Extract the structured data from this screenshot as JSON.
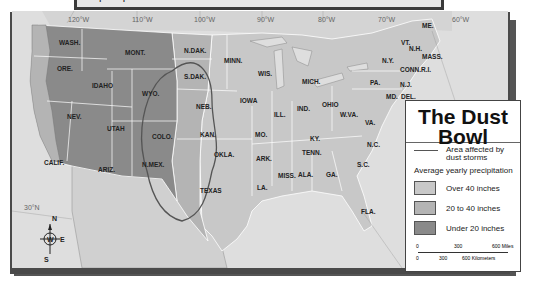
{
  "question": {
    "text": "precipitation was a cause of the Dust Bowl?"
  },
  "map": {
    "longitude_labels": [
      {
        "label": "120°W",
        "x": 62
      },
      {
        "label": "110°W",
        "x": 125
      },
      {
        "label": "100°W",
        "x": 188
      },
      {
        "label": "90°W",
        "x": 250
      },
      {
        "label": "80°W",
        "x": 311
      },
      {
        "label": "70°W",
        "x": 370
      },
      {
        "label": "60°W",
        "x": 448
      }
    ],
    "latitude_label": "30°N",
    "states": [
      {
        "name": "WASH.",
        "x": 47,
        "y": 28
      },
      {
        "name": "MONT.",
        "x": 113,
        "y": 38
      },
      {
        "name": "ORE.",
        "x": 45,
        "y": 54
      },
      {
        "name": "IDAHO",
        "x": 80,
        "y": 71
      },
      {
        "name": "WYO.",
        "x": 130,
        "y": 79
      },
      {
        "name": "N.DAK.",
        "x": 172,
        "y": 36
      },
      {
        "name": "S.DAK.",
        "x": 172,
        "y": 62
      },
      {
        "name": "MINN.",
        "x": 212,
        "y": 46
      },
      {
        "name": "WIS.",
        "x": 246,
        "y": 59
      },
      {
        "name": "MICH.",
        "x": 290,
        "y": 67
      },
      {
        "name": "NEV.",
        "x": 55,
        "y": 102
      },
      {
        "name": "UTAH",
        "x": 95,
        "y": 114
      },
      {
        "name": "COLO.",
        "x": 140,
        "y": 122
      },
      {
        "name": "NEB.",
        "x": 184,
        "y": 92
      },
      {
        "name": "IOWA",
        "x": 228,
        "y": 86
      },
      {
        "name": "ILL.",
        "x": 262,
        "y": 100
      },
      {
        "name": "IND.",
        "x": 285,
        "y": 94
      },
      {
        "name": "OHIO",
        "x": 310,
        "y": 90
      },
      {
        "name": "KAN.",
        "x": 188,
        "y": 120
      },
      {
        "name": "MO.",
        "x": 243,
        "y": 120
      },
      {
        "name": "KY.",
        "x": 298,
        "y": 124
      },
      {
        "name": "W.VA.",
        "x": 328,
        "y": 100
      },
      {
        "name": "VA.",
        "x": 353,
        "y": 108
      },
      {
        "name": "CALIF.",
        "x": 32,
        "y": 148
      },
      {
        "name": "ARIZ.",
        "x": 86,
        "y": 155
      },
      {
        "name": "N.MEX.",
        "x": 130,
        "y": 150
      },
      {
        "name": "OKLA.",
        "x": 202,
        "y": 140
      },
      {
        "name": "ARK.",
        "x": 244,
        "y": 144
      },
      {
        "name": "TENN.",
        "x": 290,
        "y": 138
      },
      {
        "name": "N.C.",
        "x": 355,
        "y": 130
      },
      {
        "name": "S.C.",
        "x": 345,
        "y": 150
      },
      {
        "name": "TEXAS",
        "x": 188,
        "y": 176
      },
      {
        "name": "LA.",
        "x": 245,
        "y": 173
      },
      {
        "name": "MISS.",
        "x": 266,
        "y": 161
      },
      {
        "name": "ALA.",
        "x": 286,
        "y": 160
      },
      {
        "name": "GA.",
        "x": 314,
        "y": 160
      },
      {
        "name": "FLA.",
        "x": 349,
        "y": 197
      },
      {
        "name": "ME.",
        "x": 410,
        "y": 11
      },
      {
        "name": "VT.",
        "x": 389,
        "y": 28
      },
      {
        "name": "N.H.",
        "x": 397,
        "y": 34
      },
      {
        "name": "N.Y.",
        "x": 370,
        "y": 46
      },
      {
        "name": "MASS.",
        "x": 410,
        "y": 42
      },
      {
        "name": "CONN.",
        "x": 388,
        "y": 55
      },
      {
        "name": "R.I.",
        "x": 409,
        "y": 55
      },
      {
        "name": "PA.",
        "x": 358,
        "y": 68
      },
      {
        "name": "N.J.",
        "x": 388,
        "y": 70
      },
      {
        "name": "MD.",
        "x": 374,
        "y": 82
      },
      {
        "name": "DEL.",
        "x": 389,
        "y": 82
      }
    ],
    "compass": {
      "n": "N",
      "s": "S",
      "e": "E",
      "w": "W"
    },
    "colors": {
      "over_40": "#c8c8c8",
      "between_20_40": "#b4b4b4",
      "under_20": "#8a8a8a",
      "water": "#dcdcdc",
      "frame": "#444444"
    }
  },
  "legend": {
    "title_line1": "The Dust",
    "title_line2": "Bowl",
    "dust_area_label": "Area affected by dust storms",
    "precip_heading": "Average yearly precipitation",
    "items": [
      {
        "label": "Over 40 inches",
        "color": "#c8c8c8"
      },
      {
        "label": "20 to 40 inches",
        "color": "#b4b4b4"
      },
      {
        "label": "Under 20 inches",
        "color": "#8a8a8a"
      }
    ],
    "scale": {
      "miles_ticks": [
        "0",
        "300",
        "600 Miles"
      ],
      "km_ticks": [
        "0",
        "300",
        "600 Kilometers"
      ]
    }
  }
}
